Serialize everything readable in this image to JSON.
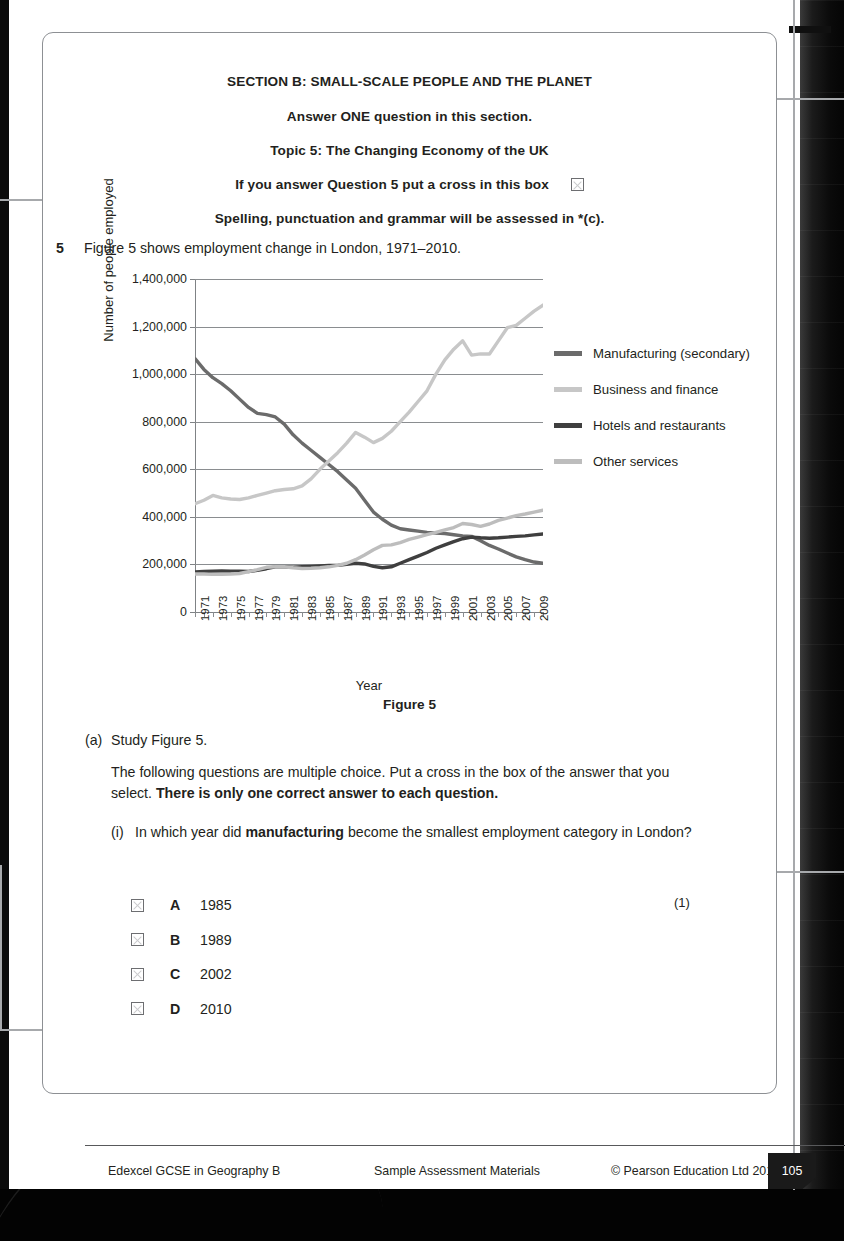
{
  "document": {
    "headings": [
      "SECTION B: SMALL-SCALE PEOPLE AND THE PLANET",
      "Answer ONE question in this section.",
      "Topic 5: The Changing Economy of the UK"
    ],
    "cross_box_line": "If you answer Question 5 put a cross in this box",
    "spg_line": "Spelling, punctuation and grammar will be assessed in *(c).",
    "question_number": "5",
    "question_stem": "Figure 5 shows employment change in London, 1971–2010.",
    "figure_caption": "Figure 5",
    "part_a_label": "(a)",
    "part_a_text": "Study Figure 5.",
    "instruction_plain": "The following questions are multiple choice. Put a cross in the box of the answer that you select. ",
    "instruction_bold": "There is only one correct answer to each question.",
    "sub_i_label": "(i)",
    "sub_i_pre": "In which year did ",
    "sub_i_bold": "manufacturing",
    "sub_i_post": " become the smallest employment category in London?",
    "marks": "(1)",
    "options": [
      {
        "letter": "A",
        "value": "1985"
      },
      {
        "letter": "B",
        "value": "1989"
      },
      {
        "letter": "C",
        "value": "2002"
      },
      {
        "letter": "D",
        "value": "2010"
      }
    ]
  },
  "footer": {
    "left": "Edexcel GCSE in Geography B",
    "middle": "Sample Assessment Materials",
    "right": "© Pearson Education Ltd 2012",
    "page_number": "105"
  },
  "colors": {
    "manufacturing": "#6b6b6b",
    "business_finance": "#c7c7c7",
    "hotels_restaurants": "#3f3f3f",
    "other_services": "#bdbdbd",
    "gridline": "#8a8d90",
    "text": "#231f20",
    "callout": "#a7a9ac"
  },
  "chart_data": {
    "type": "line",
    "title": "Figure 5",
    "xlabel": "Year",
    "ylabel": "Number of people employed",
    "ylim": [
      0,
      1400000
    ],
    "yticks": [
      "0",
      "200,000",
      "400,000",
      "600,000",
      "800,000",
      "1,000,000",
      "1,200,000",
      "1,400,000"
    ],
    "ytick_values": [
      0,
      200000,
      400000,
      600000,
      800000,
      1000000,
      1200000,
      1400000
    ],
    "grid": true,
    "legend_position": "right",
    "x": [
      1971,
      1972,
      1973,
      1974,
      1975,
      1976,
      1977,
      1978,
      1979,
      1980,
      1981,
      1982,
      1983,
      1984,
      1985,
      1986,
      1987,
      1988,
      1989,
      1990,
      1991,
      1992,
      1993,
      1994,
      1995,
      1996,
      1997,
      1998,
      1999,
      2000,
      2001,
      2002,
      2003,
      2004,
      2005,
      2006,
      2007,
      2008,
      2009,
      2010
    ],
    "xtick_labels": [
      "1971",
      "1973",
      "1975",
      "1977",
      "1979",
      "1981",
      "1983",
      "1985",
      "1987",
      "1989",
      "1991",
      "1993",
      "1995",
      "1997",
      "1999",
      "2001",
      "2003",
      "2005",
      "2007",
      "2009"
    ],
    "series": [
      {
        "name": "Manufacturing (secondary)",
        "color": "#6b6b6b",
        "values": [
          1065000,
          1020000,
          985000,
          960000,
          930000,
          895000,
          860000,
          835000,
          830000,
          820000,
          790000,
          745000,
          710000,
          680000,
          650000,
          620000,
          590000,
          555000,
          520000,
          470000,
          420000,
          390000,
          365000,
          350000,
          345000,
          340000,
          335000,
          332000,
          330000,
          325000,
          320000,
          318000,
          300000,
          280000,
          265000,
          248000,
          232000,
          220000,
          210000,
          205000
        ]
      },
      {
        "name": "Business and finance",
        "color": "#c7c7c7",
        "values": [
          455000,
          470000,
          490000,
          480000,
          475000,
          473000,
          480000,
          490000,
          500000,
          510000,
          515000,
          518000,
          530000,
          560000,
          600000,
          635000,
          670000,
          710000,
          755000,
          735000,
          712000,
          730000,
          760000,
          800000,
          840000,
          885000,
          930000,
          1000000,
          1060000,
          1105000,
          1140000,
          1080000,
          1085000,
          1085000,
          1140000,
          1195000,
          1205000,
          1235000,
          1265000,
          1290000
        ]
      },
      {
        "name": "Hotels and restaurants",
        "color": "#3f3f3f",
        "values": [
          168000,
          170000,
          172000,
          173000,
          172000,
          172000,
          170000,
          175000,
          182000,
          190000,
          190000,
          188000,
          190000,
          192000,
          194000,
          196000,
          196000,
          200000,
          205000,
          202000,
          192000,
          186000,
          190000,
          205000,
          220000,
          235000,
          250000,
          268000,
          282000,
          296000,
          308000,
          315000,
          312000,
          310000,
          312000,
          315000,
          318000,
          320000,
          324000,
          328000
        ]
      },
      {
        "name": "Other services",
        "color": "#bdbdbd",
        "values": [
          160000,
          160000,
          158000,
          159000,
          160000,
          162000,
          170000,
          178000,
          188000,
          190000,
          190000,
          186000,
          183000,
          184000,
          186000,
          190000,
          196000,
          205000,
          220000,
          240000,
          262000,
          280000,
          282000,
          292000,
          305000,
          315000,
          325000,
          335000,
          345000,
          355000,
          372000,
          368000,
          360000,
          370000,
          385000,
          395000,
          405000,
          412000,
          420000,
          428000
        ]
      }
    ]
  }
}
